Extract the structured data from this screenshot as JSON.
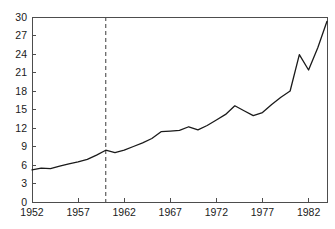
{
  "chart_data": {
    "type": "line",
    "title": "",
    "xlabel": "",
    "ylabel": "",
    "xlim": [
      1952,
      1984
    ],
    "ylim": [
      0,
      30
    ],
    "grid": false,
    "legend": "none",
    "line_color": "#1a1a1a",
    "axis_color": "#4d4d4d",
    "yticks": [
      0,
      3,
      6,
      9,
      12,
      15,
      18,
      21,
      24,
      27,
      30
    ],
    "ytick_labels": [
      "0",
      "3",
      "6",
      "9",
      "12",
      "15",
      "18",
      "21",
      "24",
      "27",
      "30"
    ],
    "xticks": [
      1952,
      1957,
      1962,
      1967,
      1972,
      1977,
      1982
    ],
    "xtick_labels": [
      "1952",
      "1957",
      "1962",
      "1967",
      "1972",
      "1977",
      "1982"
    ],
    "x": [
      1952,
      1953,
      1954,
      1955,
      1956,
      1957,
      1958,
      1959,
      1960,
      1961,
      1962,
      1963,
      1964,
      1965,
      1966,
      1967,
      1968,
      1969,
      1970,
      1971,
      1972,
      1973,
      1974,
      1975,
      1976,
      1977,
      1978,
      1979,
      1980,
      1981,
      1982,
      1983,
      1984
    ],
    "values": [
      5.2,
      5.5,
      5.4,
      5.8,
      6.2,
      6.5,
      6.9,
      7.6,
      8.4,
      8.0,
      8.4,
      9.0,
      9.6,
      10.3,
      11.4,
      11.5,
      11.6,
      12.2,
      11.7,
      12.4,
      13.3,
      14.2,
      15.6,
      14.8,
      14.0,
      14.5,
      15.8,
      17.0,
      18.0,
      23.9,
      21.4,
      25.0,
      29.3
    ],
    "annotations": [
      {
        "name": "vertical-reference-line",
        "type": "vline",
        "x": 1960,
        "style": "dashed"
      }
    ]
  }
}
